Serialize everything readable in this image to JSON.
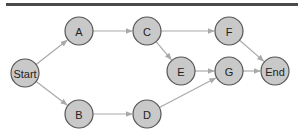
{
  "diagram": {
    "type": "directed-graph",
    "colors": {
      "node_fill": "#c9c9c9",
      "node_stroke": "#555555",
      "edge": "#a9a9a9",
      "top_bar": "#4a4a4a"
    },
    "nodes": [
      {
        "id": "Start",
        "label": "Start",
        "x": 25,
        "y": 73
      },
      {
        "id": "A",
        "label": "A",
        "x": 79,
        "y": 31
      },
      {
        "id": "B",
        "label": "B",
        "x": 79,
        "y": 114
      },
      {
        "id": "C",
        "label": "C",
        "x": 147,
        "y": 31
      },
      {
        "id": "D",
        "label": "D",
        "x": 147,
        "y": 114
      },
      {
        "id": "E",
        "label": "E",
        "x": 181,
        "y": 71
      },
      {
        "id": "F",
        "label": "F",
        "x": 229,
        "y": 31
      },
      {
        "id": "G",
        "label": "G",
        "x": 229,
        "y": 71
      },
      {
        "id": "End",
        "label": "End",
        "x": 275,
        "y": 71
      }
    ],
    "edges": [
      {
        "from": "Start",
        "to": "A"
      },
      {
        "from": "Start",
        "to": "B"
      },
      {
        "from": "A",
        "to": "C"
      },
      {
        "from": "B",
        "to": "D"
      },
      {
        "from": "C",
        "to": "F"
      },
      {
        "from": "C",
        "to": "E"
      },
      {
        "from": "E",
        "to": "G"
      },
      {
        "from": "D",
        "to": "G"
      },
      {
        "from": "F",
        "to": "End"
      },
      {
        "from": "G",
        "to": "End"
      }
    ]
  }
}
